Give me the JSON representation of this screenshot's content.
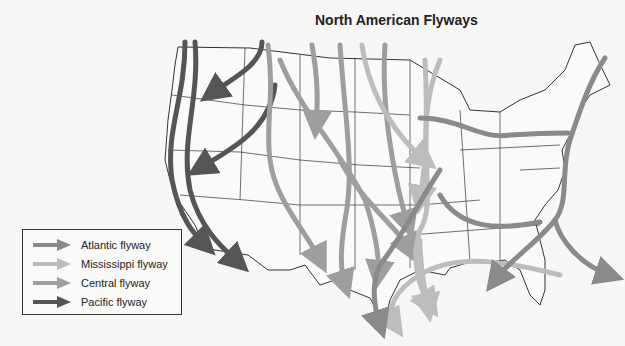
{
  "title": "North American Flyways",
  "legend": {
    "items": [
      {
        "label": "Atlantic flyway",
        "color": "#8a8a8a"
      },
      {
        "label": "Mississippi flyway",
        "color": "#bdbdbd"
      },
      {
        "label": "Central flyway",
        "color": "#9e9e9e"
      },
      {
        "label": "Pacific flyway",
        "color": "#555555"
      }
    ]
  },
  "map": {
    "region": "Contiguous United States",
    "flyways": [
      "Pacific",
      "Central",
      "Mississippi",
      "Atlantic"
    ]
  }
}
